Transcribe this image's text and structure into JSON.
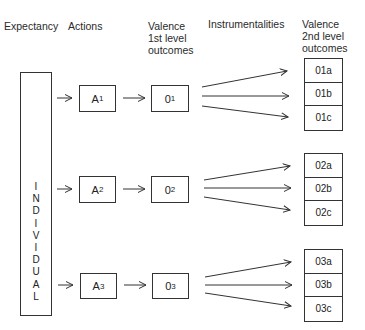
{
  "headers": {
    "expectancy": "Expectancy",
    "actions": "Actions",
    "valence1": [
      "Valence",
      "1st level",
      "outcomes"
    ],
    "instrumentalities": "Instrumentalities",
    "valence2": [
      "Valence",
      "2nd level",
      "outcomes"
    ]
  },
  "individual": {
    "letters": [
      "I",
      "N",
      "D",
      "I",
      "V",
      "I",
      "D",
      "U",
      "A",
      "L"
    ]
  },
  "rows": [
    {
      "action": {
        "base": "A",
        "sub": "1"
      },
      "outcome": {
        "base": "0",
        "sub": "1"
      },
      "second_level": [
        "01a",
        "01b",
        "01c"
      ]
    },
    {
      "action": {
        "base": "A",
        "sub": "2"
      },
      "outcome": {
        "base": "0",
        "sub": "2"
      },
      "second_level": [
        "02a",
        "02b",
        "02c"
      ]
    },
    {
      "action": {
        "base": "A",
        "sub": "3"
      },
      "outcome": {
        "base": "0",
        "sub": "3"
      },
      "second_level": [
        "03a",
        "03b",
        "03c"
      ]
    }
  ],
  "colors": {
    "line": "#333333",
    "text": "#222222",
    "background": "#ffffff"
  }
}
